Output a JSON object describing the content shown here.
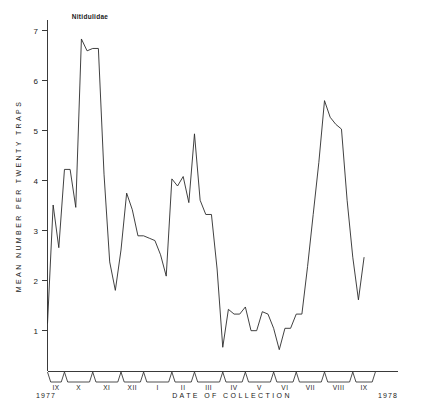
{
  "chart_data": {
    "type": "line",
    "title": "Nitidulidae",
    "xlabel": "DATE OF COLLECTION",
    "ylabel": "MEAN NUMBER PER TWENTY TRAPS",
    "ylim": [
      0,
      7.4
    ],
    "yticks": [
      1,
      2,
      3,
      4,
      5,
      6,
      7
    ],
    "ytick_labels": [
      "1",
      "2",
      "3",
      "4",
      "5",
      "6",
      "7"
    ],
    "grid": false,
    "legend": "none",
    "xlim": [
      0,
      62
    ],
    "x_axis_groups": [
      {
        "label": "IX",
        "start": 0,
        "end": 3
      },
      {
        "label": "X",
        "start": 3,
        "end": 8
      },
      {
        "label": "XI",
        "start": 8,
        "end": 13
      },
      {
        "label": "XII",
        "start": 13,
        "end": 17
      },
      {
        "label": "I",
        "start": 17,
        "end": 22
      },
      {
        "label": "II",
        "start": 22,
        "end": 26
      },
      {
        "label": "III",
        "start": 26,
        "end": 31
      },
      {
        "label": "IV",
        "start": 31,
        "end": 35
      },
      {
        "label": "V",
        "start": 35,
        "end": 40
      },
      {
        "label": "VI",
        "start": 40,
        "end": 44
      },
      {
        "label": "VII",
        "start": 44,
        "end": 49
      },
      {
        "label": "VIII",
        "start": 49,
        "end": 54
      },
      {
        "label": "IX",
        "start": 54,
        "end": 58
      }
    ],
    "year_start_label": "1977",
    "year_end_label": "1978",
    "x": [
      0,
      1,
      2,
      3,
      4,
      5,
      6,
      7,
      8,
      9,
      10,
      11,
      12,
      13,
      14,
      15,
      16,
      17,
      18,
      19,
      20,
      21,
      22,
      23,
      24,
      25,
      26,
      27,
      28,
      29,
      30,
      31,
      32,
      33,
      34,
      35,
      36,
      37,
      38,
      39,
      40,
      41,
      42,
      43,
      44,
      45,
      46,
      47,
      48,
      49,
      50,
      51,
      52,
      53,
      54,
      55,
      56
    ],
    "values": [
      1.0,
      3.5,
      2.6,
      4.25,
      4.25,
      3.45,
      7.0,
      6.75,
      6.8,
      6.8,
      4.15,
      2.3,
      1.7,
      2.55,
      3.75,
      3.4,
      2.85,
      2.85,
      2.8,
      2.75,
      2.45,
      2.0,
      4.05,
      3.9,
      4.1,
      3.55,
      5.0,
      3.6,
      3.3,
      3.3,
      2.15,
      0.5,
      1.3,
      1.2,
      1.2,
      1.35,
      0.85,
      0.85,
      1.25,
      1.2,
      0.9,
      0.45,
      0.9,
      0.9,
      1.2,
      1.2,
      2.2,
      3.3,
      4.4,
      5.7,
      5.35,
      5.2,
      5.1,
      3.6,
      2.4,
      1.5,
      2.4
    ],
    "series_name": "Nitidulidae"
  },
  "figure": {
    "ytick_label_values": [
      "7",
      "6",
      "5",
      "4",
      "3",
      "2",
      "1"
    ]
  }
}
